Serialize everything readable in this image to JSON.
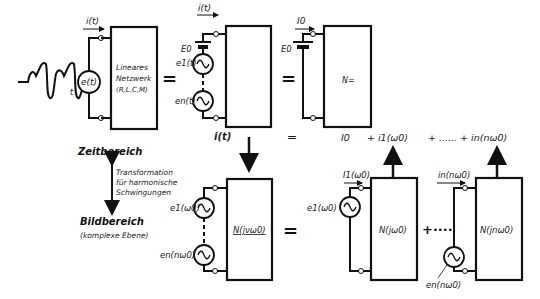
{
  "diagram": {
    "top_row": {
      "input_signal_label": "t",
      "source_label": "e(t)",
      "current_label": "i(t)",
      "network_box_lines": [
        "Lineares",
        "Netzwerk",
        "(R,L,C,M)"
      ],
      "equals": "=",
      "decomposed": {
        "current_label": "i(t)",
        "dc_source_label": "E0",
        "ac_source_1_label": "e1(t)",
        "ac_source_n_label": "en(t)"
      },
      "dc_network": {
        "current_label": "I0",
        "dc_source_label": "E0",
        "box_label": "N="
      }
    },
    "sum_row": {
      "left": "i(t)",
      "equals": "=",
      "terms": [
        "I0",
        "+ i1(ω0)",
        "+ ...... + in(nω0)"
      ]
    },
    "domains": {
      "time_domain": "Zeitbereich",
      "transform_lines": [
        "Transformation",
        "für harmonische",
        "Schwingungen"
      ],
      "image_domain": "Bildbereich",
      "image_domain_sub": "(komplexe Ebene)"
    },
    "bottom_row": {
      "source_1_label": "e1(ω0)",
      "source_n_label": "en(nω0)",
      "network_box_label": "N(jνω0)",
      "equals": "=",
      "harmonic_1": {
        "current_label": "I1(ω0)",
        "source_label": "e1(ω0)",
        "box_label": "N(jω0)"
      },
      "plus_dots": "+····",
      "harmonic_n": {
        "current_label": "in(nω0)",
        "source_label": "en(nω0)",
        "box_label": "N(jnω0)"
      }
    }
  }
}
